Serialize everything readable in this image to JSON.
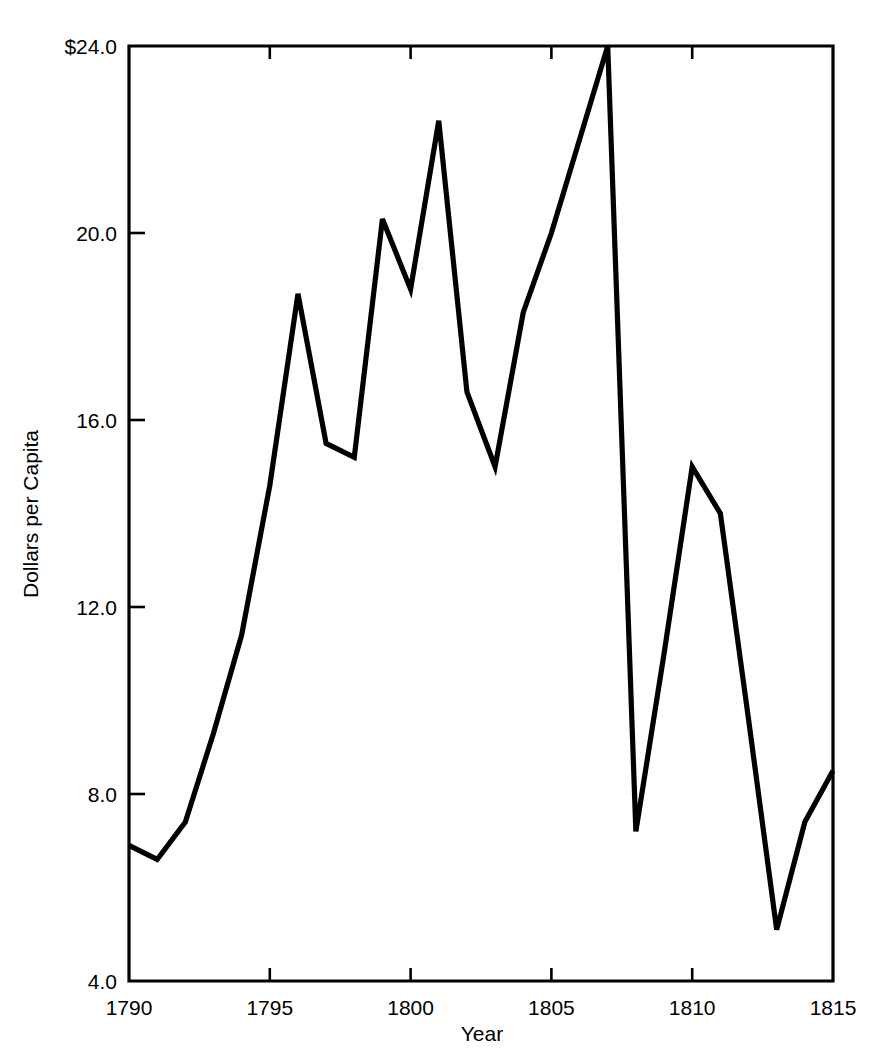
{
  "chart_data": {
    "type": "line",
    "title": "",
    "subtitle": "",
    "xlabel": "Year",
    "ylabel": "Dollars per Capita",
    "xlim": [
      1790,
      1815
    ],
    "ylim": [
      4.0,
      24.0
    ],
    "grid": false,
    "legend": "none",
    "x_tick_labels": [
      "1790",
      "1795",
      "1800",
      "1805",
      "1810",
      "1815"
    ],
    "x_ticks": [
      1790,
      1795,
      1800,
      1805,
      1810,
      1815
    ],
    "y_tick_labels": [
      "$24.0",
      "20.0",
      "16.0",
      "12.0",
      "8.0",
      "4.0"
    ],
    "y_ticks": [
      24.0,
      20.0,
      16.0,
      12.0,
      8.0,
      4.0
    ],
    "series": [
      {
        "name": "Dollars per Capita",
        "color": "#000000",
        "x": [
          1790,
          1791,
          1792,
          1793,
          1794,
          1795,
          1796,
          1797,
          1798,
          1799,
          1800,
          1801,
          1802,
          1803,
          1804,
          1805,
          1806,
          1807,
          1808,
          1809,
          1810,
          1811,
          1812,
          1813,
          1814,
          1815
        ],
        "values": [
          6.9,
          6.6,
          7.4,
          9.3,
          11.4,
          14.6,
          18.7,
          15.5,
          15.2,
          20.3,
          18.8,
          22.4,
          16.6,
          15.0,
          18.3,
          20.0,
          22.0,
          24.0,
          7.2,
          11.0,
          15.0,
          14.0,
          9.6,
          5.1,
          7.4,
          8.5
        ]
      }
    ],
    "annotations": []
  },
  "axis": {
    "y_axis_title": "Dollars per Capita",
    "x_axis_title": "Year"
  }
}
